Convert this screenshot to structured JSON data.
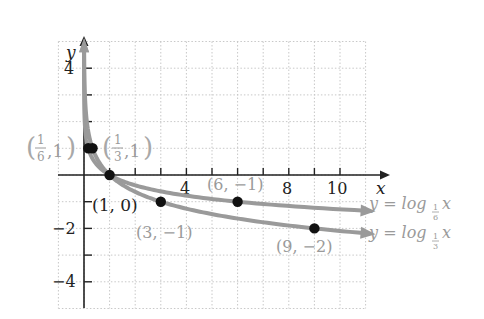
{
  "chart_data": {
    "type": "line",
    "title": "",
    "xlabel": "x",
    "ylabel": "y",
    "xlim": [
      -1,
      11
    ],
    "ylim": [
      -5,
      5
    ],
    "grid": true,
    "x_tick_labels": [
      {
        "value": 4,
        "label": "4"
      },
      {
        "value": 8,
        "label": "8"
      },
      {
        "value": 10,
        "label": "10"
      }
    ],
    "y_tick_labels": [
      {
        "value": 4,
        "label": "4"
      },
      {
        "value": -2,
        "label": "−2"
      },
      {
        "value": -4,
        "label": "−4"
      }
    ],
    "series": [
      {
        "name": "y = log_{1/6} x",
        "label_prefix": "y = log",
        "base_num": "1",
        "base_den": "6",
        "label_suffix": "x",
        "base": 0.16666667,
        "x_end": 11,
        "points": [
          {
            "x": 0.16666667,
            "y": 1,
            "label_num": "1",
            "label_den": "6",
            "label_rest": ", 1"
          },
          {
            "x": 1,
            "y": 0,
            "label": "(1, 0)"
          },
          {
            "x": 6,
            "y": -1,
            "label": "(6, −1)"
          }
        ]
      },
      {
        "name": "y = log_{1/3} x",
        "label_prefix": "y = log",
        "base_num": "1",
        "base_den": "3",
        "label_suffix": "x",
        "base": 0.33333333,
        "x_end": 11,
        "points": [
          {
            "x": 0.33333333,
            "y": 1,
            "label_num": "1",
            "label_den": "3",
            "label_rest": ", 1"
          },
          {
            "x": 1,
            "y": 0,
            "label": "(1, 0)"
          },
          {
            "x": 3,
            "y": -1,
            "label": "(3, −1)"
          },
          {
            "x": 9,
            "y": -2,
            "label": "(9, −2)"
          }
        ]
      }
    ],
    "point_labels": {
      "p16": {
        "num": "1",
        "den": "6",
        "rest": ",1"
      },
      "p13": {
        "num": "1",
        "den": "3",
        "rest": ",1"
      },
      "p10": "(1, 0)",
      "p31": "(3, −1)",
      "p61": "(6, −1)",
      "p92": "(9, −2)"
    },
    "colors": {
      "curve": "#9a9a9a",
      "axis": "#222222",
      "grid": "#c8c8c8",
      "point": "#111111",
      "label_gray": "#9a9a9a",
      "label_dark": "#222222"
    }
  }
}
